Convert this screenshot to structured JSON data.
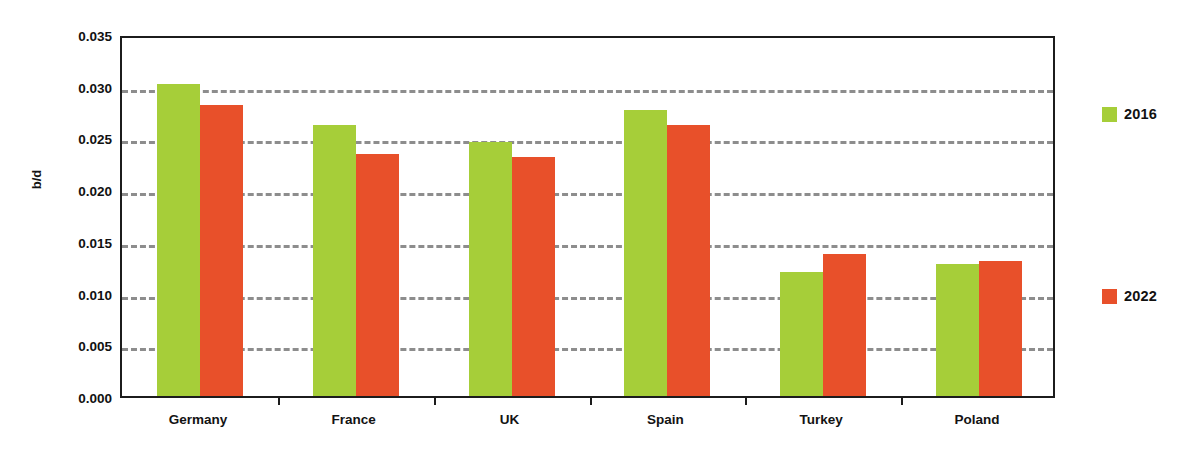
{
  "chart_data": {
    "type": "bar",
    "title": "",
    "xlabel": "",
    "ylabel": "b/d",
    "categories": [
      "Germany",
      "France",
      "UK",
      "Spain",
      "Turkey",
      "Poland"
    ],
    "series": [
      {
        "name": "2016",
        "color": "#a6ce39",
        "values": [
          0.0302,
          0.0262,
          0.0246,
          0.0277,
          0.012,
          0.0128
        ]
      },
      {
        "name": "2022",
        "color": "#e8502a",
        "values": [
          0.0281,
          0.0234,
          0.0231,
          0.0262,
          0.0137,
          0.0131
        ]
      }
    ],
    "ylim": [
      0.0,
      0.035
    ],
    "yticks": [
      "0.000",
      "0.005",
      "0.010",
      "0.015",
      "0.020",
      "0.025",
      "0.030",
      "0.035"
    ],
    "ytick_values": [
      0.0,
      0.005,
      0.01,
      0.015,
      0.02,
      0.025,
      0.03,
      0.035
    ],
    "grid": true,
    "grid_style": "dashed",
    "grid_color": "#8d8d8d",
    "legend_position": "right",
    "axis_color": "#1c1c1c"
  },
  "legend": {
    "items": [
      {
        "label": "2016",
        "color": "#a6ce39"
      },
      {
        "label": "2022",
        "color": "#e8502a"
      }
    ]
  }
}
